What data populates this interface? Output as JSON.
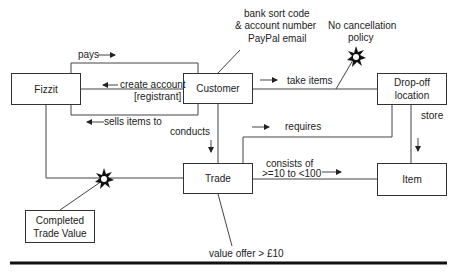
{
  "diagram": {
    "entities": {
      "fizzit": "Fizzit",
      "customer": "Customer",
      "dropoff_line1": "Drop-off",
      "dropoff_line2": "location",
      "trade": "Trade",
      "item": "Item",
      "ctv_line1": "Completed",
      "ctv_line2": "Trade Value"
    },
    "relationships": {
      "pays": "pays",
      "create_account": "create account",
      "registrant": "[registrant]",
      "sells_items_to": "sells items to",
      "take_items": "take items",
      "conducts": "conducts",
      "requires": "requires",
      "store": "store",
      "consists_of": "consists of",
      "consists_range": ">=10 to <100"
    },
    "annotations": {
      "bank_line1": "bank sort code",
      "bank_line2": "& account number",
      "bank_line3": "PayPal email",
      "nocancel_line1": "No cancellation",
      "nocancel_line2": "policy",
      "value_offer": "value offer > £10"
    }
  }
}
